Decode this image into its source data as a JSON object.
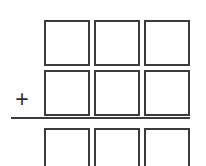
{
  "worksheet": {
    "type": "column-addition-problem",
    "operator_symbol": "+",
    "columns": 3,
    "colors": {
      "background": "#ffffff",
      "box_border": "#3b3b3b",
      "rule_line": "#3b3b3b",
      "operator": "#2e2e2e"
    },
    "rows": [
      {
        "name": "first-addend",
        "cells": [
          {
            "name": "first-addend-hundreds",
            "value": ""
          },
          {
            "name": "first-addend-tens",
            "value": ""
          },
          {
            "name": "first-addend-ones",
            "value": ""
          }
        ]
      },
      {
        "name": "second-addend",
        "cells": [
          {
            "name": "second-addend-hundreds",
            "value": ""
          },
          {
            "name": "second-addend-tens",
            "value": ""
          },
          {
            "name": "second-addend-ones",
            "value": ""
          }
        ]
      },
      {
        "name": "sum",
        "cells": [
          {
            "name": "sum-hundreds",
            "value": ""
          },
          {
            "name": "sum-tens",
            "value": ""
          },
          {
            "name": "sum-ones",
            "value": ""
          }
        ]
      }
    ]
  }
}
